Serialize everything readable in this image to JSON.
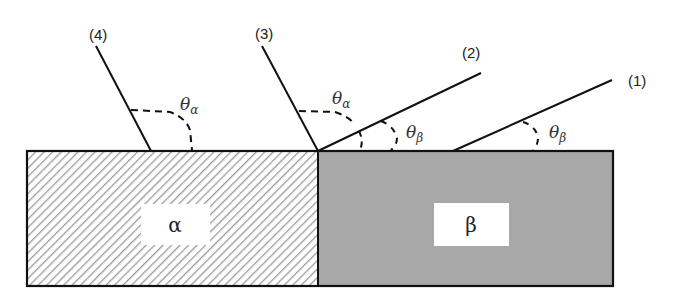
{
  "diagram": {
    "type": "contact-angle-schematic",
    "phases": [
      {
        "id": "alpha",
        "label": "α",
        "fill": "hatched",
        "hatch_color": "#9a9a9a"
      },
      {
        "id": "beta",
        "label": "β",
        "fill": "#a8a8a8"
      }
    ],
    "lines": [
      {
        "id": "1",
        "label": "(1)",
        "angle_label": "θ",
        "angle_sub": "β"
      },
      {
        "id": "2",
        "label": "(2)",
        "angle_label": "θ",
        "angle_sub": "β"
      },
      {
        "id": "3",
        "label": "(3)",
        "angle_label": "θ",
        "angle_sub": "α"
      },
      {
        "id": "4",
        "label": "(4)",
        "angle_label": "θ",
        "angle_sub": "α"
      }
    ],
    "colors": {
      "line": "#111111",
      "border": "#111111",
      "beta_fill": "#a8a8a8",
      "hatch": "#9a9a9a",
      "label_box": "#ffffff"
    }
  }
}
